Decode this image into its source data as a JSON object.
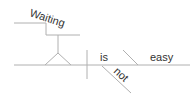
{
  "diagram": {
    "type": "sentence-diagram",
    "words": {
      "subject_gerund": "Waiting",
      "verb": "is",
      "predicate_adjective": "easy",
      "modifier": "not"
    },
    "colors": {
      "line": "#b0b0b0",
      "text": "#333333"
    }
  }
}
